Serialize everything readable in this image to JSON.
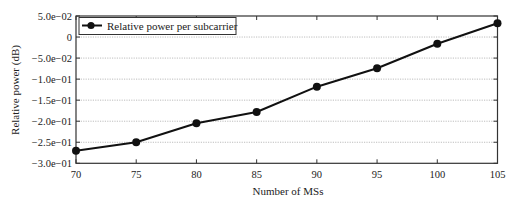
{
  "chart_data": {
    "type": "line",
    "title": "",
    "xlabel": "Number of MSs",
    "ylabel": "Relative power (dB)",
    "x": [
      70,
      75,
      80,
      85,
      90,
      95,
      100,
      105
    ],
    "series": [
      {
        "name": "Relative power per subcarrier",
        "values": [
          -0.27,
          -0.25,
          -0.205,
          -0.178,
          -0.118,
          -0.074,
          -0.016,
          0.033
        ],
        "color": "#111111",
        "marker": "circle"
      }
    ],
    "xlim": [
      70,
      105
    ],
    "ylim": [
      -0.3,
      0.05
    ],
    "xticks": [
      70,
      75,
      80,
      85,
      90,
      95,
      100,
      105
    ],
    "xtick_labels": [
      "70",
      "75",
      "80",
      "85",
      "90",
      "95",
      "100",
      "105"
    ],
    "yticks": [
      0.05,
      0,
      -0.05,
      -0.1,
      -0.15,
      -0.2,
      -0.25,
      -0.3
    ],
    "ytick_labels": [
      "5.0e−02",
      "0",
      "−5.0e−02",
      "−1.0e−01",
      "−1.5e−01",
      "−2.0e−01",
      "−2.5e−01",
      "−3.0e−01"
    ],
    "grid": {
      "y": true,
      "x": false,
      "style": "dotted",
      "color": "#bdbdbd"
    },
    "legend": {
      "position": "upper left",
      "entries": [
        "Relative power per subcarrier"
      ]
    }
  }
}
